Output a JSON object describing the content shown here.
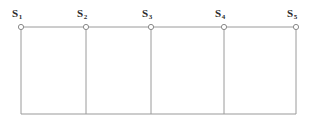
{
  "diagram": {
    "type": "node-chain-schematic",
    "canvas": {
      "width": 315,
      "height": 125,
      "background": "#ffffff"
    },
    "style": {
      "line_color": "#9a9a9a",
      "line_width": 1,
      "node_stroke": "#8a8a8a",
      "node_fill": "#ffffff",
      "node_radius": 2.6,
      "label_color": "#2b2b2b"
    },
    "geometry": {
      "top_line_y": 27,
      "bottom_line_y": 114,
      "left_x": 21,
      "right_x": 296
    },
    "nodes": [
      {
        "id": "S1",
        "base": "S",
        "subscript": "1",
        "x": 21,
        "y": 27,
        "label_x": 12,
        "label_y": 8
      },
      {
        "id": "S2",
        "base": "S",
        "subscript": "2",
        "x": 86,
        "y": 27,
        "label_x": 77,
        "label_y": 8
      },
      {
        "id": "S3",
        "base": "S",
        "subscript": "3",
        "x": 151,
        "y": 27,
        "label_x": 142,
        "label_y": 8
      },
      {
        "id": "S4",
        "base": "S",
        "subscript": "4",
        "x": 224,
        "y": 27,
        "label_x": 215,
        "label_y": 8
      },
      {
        "id": "S5",
        "base": "S",
        "subscript": "5",
        "x": 296,
        "y": 27,
        "label_x": 287,
        "label_y": 8
      }
    ],
    "edges": {
      "top_segments": [
        {
          "from": "S1",
          "to": "S2"
        },
        {
          "from": "S2",
          "to": "S3"
        },
        {
          "from": "S3",
          "to": "S4"
        },
        {
          "from": "S4",
          "to": "S5"
        }
      ],
      "verticals": [
        {
          "node": "S1",
          "x": 21
        },
        {
          "node": "S2",
          "x": 86
        },
        {
          "node": "S3",
          "x": 151
        },
        {
          "node": "S4",
          "x": 224
        },
        {
          "node": "S5",
          "x": 296
        }
      ],
      "bottom_segments": [
        {
          "from_x": 21,
          "to_x": 86
        },
        {
          "from_x": 86,
          "to_x": 151
        },
        {
          "from_x": 151,
          "to_x": 224
        },
        {
          "from_x": 224,
          "to_x": 296
        }
      ]
    },
    "cells": [
      {
        "index": 1,
        "left_node": "S1",
        "right_node": "S2"
      },
      {
        "index": 2,
        "left_node": "S2",
        "right_node": "S3"
      },
      {
        "index": 3,
        "left_node": "S3",
        "right_node": "S4"
      },
      {
        "index": 4,
        "left_node": "S4",
        "right_node": "S5"
      }
    ]
  }
}
